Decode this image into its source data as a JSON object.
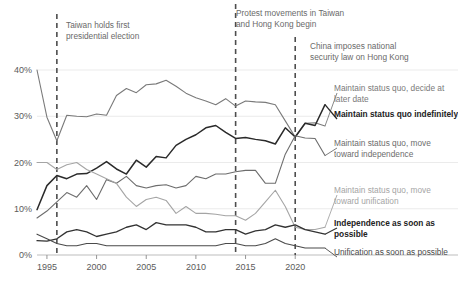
{
  "chart_data": {
    "type": "line",
    "title": "",
    "subtitle": "",
    "xlabel": "",
    "ylabel": "",
    "xlim": [
      1994,
      2023
    ],
    "ylim": [
      0,
      42
    ],
    "grid": "horizontal",
    "legend_position": "right-inline",
    "x_ticks": [
      "1995",
      "2000",
      "2005",
      "2010",
      "2015",
      "2020"
    ],
    "x_tick_values": [
      1995,
      2000,
      2005,
      2010,
      2015,
      2020
    ],
    "y_ticks": [
      "0%",
      "10%",
      "20%",
      "30%",
      "40%"
    ],
    "y_tick_values": [
      0,
      10,
      20,
      30,
      40
    ],
    "x": [
      1994,
      1995,
      1996,
      1997,
      1998,
      1999,
      2000,
      2001,
      2002,
      2003,
      2004,
      2005,
      2006,
      2007,
      2008,
      2009,
      2010,
      2011,
      2012,
      2013,
      2014,
      2015,
      2016,
      2017,
      2018,
      2019,
      2020,
      2021,
      2022,
      2023
    ],
    "series": [
      {
        "name": "Maintain status quo, decide at later date",
        "color": "#7a7a7a",
        "width": 1.1,
        "bold": false,
        "label_y": 93,
        "values": [
          40.0,
          29.8,
          24.7,
          30.2,
          30.0,
          29.9,
          30.5,
          30.2,
          34.5,
          36.0,
          35.1,
          36.8,
          37.0,
          37.8,
          36.5,
          35.0,
          34.0,
          33.3,
          32.5,
          33.8,
          32.2,
          33.3,
          33.1,
          33.0,
          32.5,
          29.0,
          25.5,
          28.5,
          28.6,
          27.9
        ]
      },
      {
        "name": "Maintain status quo indefinitely",
        "color": "#2a2a2a",
        "width": 1.5,
        "bold": true,
        "label_y": 119,
        "values": [
          9.8,
          15.0,
          17.2,
          16.5,
          17.5,
          17.6,
          18.8,
          20.2,
          18.6,
          17.5,
          20.5,
          19.0,
          21.3,
          21.0,
          23.7,
          25.0,
          26.0,
          27.5,
          28.0,
          26.5,
          25.2,
          25.4,
          25.0,
          24.7,
          24.0,
          27.5,
          25.5,
          28.5,
          28.0,
          32.5
        ]
      },
      {
        "name": "Maintain status quo, move toward independence",
        "color": "#6d6d6d",
        "width": 1.1,
        "bold": false,
        "label_y": 148,
        "values": [
          8.0,
          9.5,
          11.5,
          13.5,
          12.5,
          15.0,
          12.0,
          16.3,
          15.5,
          17.0,
          15.0,
          14.5,
          15.0,
          15.2,
          14.5,
          15.0,
          17.0,
          16.5,
          17.5,
          17.5,
          18.0,
          18.3,
          18.3,
          15.5,
          15.5,
          21.8,
          25.8,
          25.3,
          25.2,
          21.5
        ]
      },
      {
        "name": "Maintain status quo, move toward unification",
        "color": "#a5a5a5",
        "width": 1.1,
        "bold": false,
        "label_y": 195,
        "values": [
          20.0,
          20.0,
          18.5,
          19.5,
          20.0,
          18.5,
          17.5,
          16.5,
          15.5,
          12.5,
          10.5,
          12.0,
          12.5,
          11.8,
          9.0,
          10.5,
          9.0,
          9.0,
          8.8,
          8.5,
          8.5,
          7.5,
          9.0,
          11.5,
          14.0,
          10.5,
          6.0,
          5.5,
          5.5,
          6.0
        ]
      },
      {
        "name": "Independence as soon as possible",
        "color": "#333333",
        "width": 1.3,
        "bold": true,
        "label_y": 228,
        "values": [
          3.1,
          3.0,
          3.5,
          5.0,
          5.5,
          5.0,
          4.0,
          4.5,
          5.0,
          6.0,
          6.5,
          5.5,
          7.0,
          6.5,
          6.5,
          6.5,
          6.0,
          5.0,
          5.0,
          5.5,
          5.5,
          4.5,
          5.2,
          5.5,
          6.5,
          6.0,
          6.5,
          5.5,
          5.0,
          4.5
        ]
      },
      {
        "name": "Unification as soon as possible",
        "color": "#4a4a4a",
        "width": 1.1,
        "bold": false,
        "label_y": 257,
        "values": [
          4.5,
          3.5,
          2.5,
          2.0,
          2.0,
          2.5,
          2.5,
          2.0,
          2.0,
          2.0,
          2.0,
          2.0,
          2.0,
          2.0,
          2.0,
          2.0,
          2.0,
          2.0,
          2.0,
          2.5,
          2.5,
          2.0,
          2.0,
          2.5,
          3.5,
          2.5,
          2.0,
          1.5,
          1.5,
          1.5
        ]
      }
    ],
    "annotations": [
      {
        "id": "taiwan-first-election",
        "text": "Taiwan holds first\npresidential election",
        "year": 1996,
        "label_left": 66,
        "label_top": 20,
        "line_top": 14,
        "line_bottom": 255
      },
      {
        "id": "protest-movements",
        "text": "Protest movements in Taiwan\nand Hong Kong begin",
        "year": 2014,
        "label_left": 236,
        "label_top": 8,
        "line_top": 4,
        "line_bottom": 255
      },
      {
        "id": "national-security-law",
        "text": "China imposes national\nsecurity law on Hong Kong",
        "year": 2020,
        "label_left": 310,
        "label_top": 41,
        "line_top": 37,
        "line_bottom": 255
      }
    ]
  }
}
